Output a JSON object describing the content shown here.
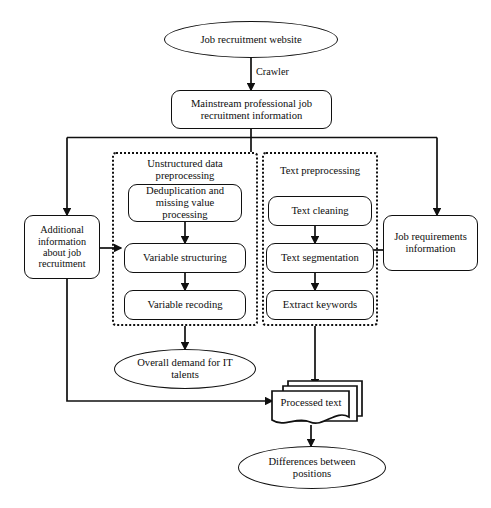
{
  "diagram": {
    "background": "#ffffff",
    "stroke": "#101010"
  },
  "nodes": {
    "source": {
      "label": "Job recruitment website",
      "shape": "ellipse"
    },
    "mainstream": {
      "label": "Mainstream professional job recruitment information",
      "line1": "Mainstream professional job",
      "line2": "recruitment information",
      "shape": "rounded-rect"
    },
    "additional_info": {
      "label": "Additional information about job recruitment",
      "line1": "Additional",
      "line2": "information",
      "line3": "about job",
      "line4": "recruitment",
      "shape": "rounded-rect"
    },
    "job_requirements": {
      "label": "Job requirements information",
      "line1": "Job requirements",
      "line2": "information",
      "shape": "rounded-rect"
    },
    "dedup": {
      "label": "Deduplication and missing value processing",
      "line1": "Deduplication and",
      "line2": "missing value",
      "line3": "processing",
      "shape": "rounded-rect"
    },
    "variable_structuring": {
      "label": "Variable structuring",
      "shape": "rounded-rect"
    },
    "variable_recoding": {
      "label": "Variable recoding",
      "shape": "rounded-rect"
    },
    "text_cleaning": {
      "label": "Text cleaning",
      "shape": "rounded-rect"
    },
    "text_segmentation": {
      "label": "Text segmentation",
      "shape": "rounded-rect"
    },
    "extract_keywords": {
      "label": "Extract keywords",
      "shape": "rounded-rect"
    },
    "overall_demand": {
      "label": "Overall demand for IT talents",
      "line1": "Overall demand for IT",
      "line2": "talents",
      "shape": "ellipse"
    },
    "processed_text": {
      "label": "Processed text",
      "shape": "multi-document"
    },
    "differences": {
      "label": "Differences between positions",
      "line1": "Differences between",
      "line2": "positions",
      "shape": "ellipse"
    }
  },
  "groups": {
    "unstructured": {
      "title": "Unstructured data preprocessing",
      "line1": "Unstructured data",
      "line2": "preprocessing",
      "style": "dotted"
    },
    "text_preprocessing": {
      "title": "Text preprocessing",
      "line1": "Text preprocessing",
      "style": "dotted"
    }
  },
  "edges": {
    "crawler_label": "Crawler"
  },
  "caption": {
    "text": ""
  }
}
